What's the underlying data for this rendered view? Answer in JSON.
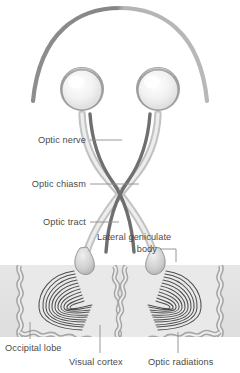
{
  "figure": {
    "background_color": "#ffffff",
    "width": 240,
    "height": 373
  },
  "palette": {
    "label_text": "#4a4a4a",
    "leader_line": "#8d8d8d",
    "skull_arc_left": "#8a8a8a",
    "skull_arc_right": "#b0b0b0",
    "eye_outer": "#9a9a9a",
    "eye_sclera": "#efefef",
    "eye_highlight": "#ffffff",
    "nerve_light": "#c9c9c9",
    "nerve_dark": "#6f6f6f",
    "nerve_mid": "#9d9d9d",
    "brain_band": "#e3e3e3",
    "cortex_ribbon": "#a8a8a8",
    "cortex_fill": "#e8e8e8",
    "radiation_fiber": "#4f4f4f",
    "lgb_body": "#cfcfcf",
    "lgb_edge": "#8f8f8f"
  },
  "labels": [
    {
      "id": "optic-nerve",
      "text": "Optic nerve",
      "anchor": "end",
      "x": 86,
      "y": 143,
      "leader": "M 90 140 L 122 140"
    },
    {
      "id": "optic-chiasm",
      "text": "Optic chiasm",
      "anchor": "end",
      "x": 86,
      "y": 187,
      "leader": "M 90 184 L 139 184"
    },
    {
      "id": "optic-tract",
      "text": "Optic tract",
      "anchor": "end",
      "x": 86,
      "y": 225,
      "leader": "M 90 222 L 119 222"
    },
    {
      "id": "lateral-geniculate-body",
      "text": "Lateral geniculate",
      "anchor": "start",
      "x": 97,
      "y": 240,
      "leader": ""
    },
    {
      "id": "lateral-geniculate-body-line2",
      "text": "body",
      "anchor": "end",
      "x": 157,
      "y": 252,
      "leader": "M 160 249 L 176 249 L 176 262"
    },
    {
      "id": "occipital-lobe",
      "text": "Occipital lobe",
      "anchor": "start",
      "x": 5,
      "y": 351,
      "leader": "M 30 339 L 30 322"
    },
    {
      "id": "visual-cortex",
      "text": "Visual cortex",
      "anchor": "start",
      "x": 69,
      "y": 365,
      "leader": "M 100 353 L 100 325"
    },
    {
      "id": "optic-radiations",
      "text": "Optic radiations",
      "anchor": "start",
      "x": 148,
      "y": 365,
      "leader": "M 178 353 L 178 332"
    }
  ],
  "structures": {
    "skull_arc": "Cranial outline arc",
    "left_eye": "Left eyeball",
    "right_eye": "Right eyeball",
    "chiasm": "Optic chiasm crossing",
    "left_lgb": "Left lateral geniculate body",
    "right_lgb": "Right lateral geniculate body",
    "left_occipital": "Left occipital lobe",
    "right_occipital": "Right occipital lobe",
    "radiation_fiber_count": 11
  }
}
